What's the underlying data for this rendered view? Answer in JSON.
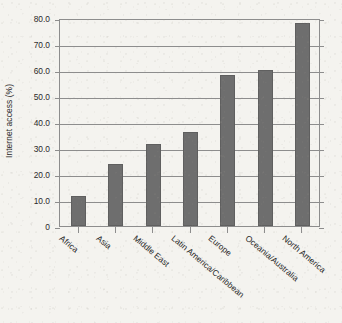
{
  "chart_data": {
    "type": "bar",
    "title": "",
    "xlabel": "",
    "ylabel": "Internet access (%)",
    "categories": [
      "Africa",
      "Asia",
      "Middle East",
      "Latin America/Caribbean",
      "Europe",
      "Oceania/Australia",
      "North America"
    ],
    "values": [
      11.5,
      23.8,
      31.5,
      36.0,
      58.0,
      60.0,
      78.0
    ],
    "ylim": [
      0,
      80
    ],
    "yticks": [
      0,
      10,
      20,
      30,
      40,
      50,
      60,
      70,
      80
    ],
    "ytick_labels": [
      "0",
      "10.0",
      "20.0",
      "30.0",
      "40.0",
      "50.0",
      "60.0",
      "70.0",
      "80.0"
    ],
    "grid": true,
    "grid_axis": "y",
    "legend": false,
    "legend_position": "none",
    "bar_color": "#6e6e6e",
    "axis_color": "#8d8d8d",
    "background_color": "#f4f3ef",
    "text_color": "#2a2a2a",
    "xtick_label_rotation": 40
  }
}
